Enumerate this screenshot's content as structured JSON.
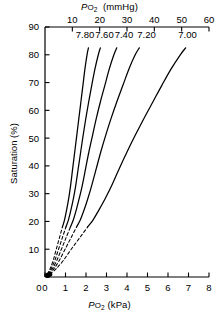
{
  "figure": {
    "title_top": {
      "symbol_p": "P",
      "symbol_o": "O",
      "symbol_sub": "2",
      "units": "(mmHg)"
    },
    "title_bottom": {
      "symbol_p": "P",
      "symbol_o": "O",
      "symbol_sub": "2",
      "units": "(kPa)"
    },
    "title_y": "Saturation (%)",
    "line_color": "#000000",
    "background_color": "#ffffff"
  },
  "chart_data": {
    "type": "line",
    "title": "",
    "xlabel": "PO2 (kPa)",
    "ylabel": "Saturation (%)",
    "xlabel_top": "PO2 (mmHg)",
    "xlim": [
      0,
      8
    ],
    "ylim": [
      0,
      90
    ],
    "xlim_top": [
      0,
      60
    ],
    "grid": false,
    "legend": "inline-curve-labels",
    "x_ticks": [
      0,
      1,
      2,
      3,
      4,
      5,
      6,
      7,
      8
    ],
    "x_tick_labels": [
      "0",
      "1",
      "2",
      "3",
      "4",
      "5",
      "6",
      "7",
      "8"
    ],
    "x_ticks_top": [
      10,
      20,
      30,
      40,
      50,
      60
    ],
    "x_tick_labels_top": [
      "10",
      "20",
      "30",
      "40",
      "50",
      "60"
    ],
    "y_ticks": [
      10,
      20,
      30,
      40,
      50,
      60,
      70,
      80,
      90
    ],
    "y_tick_labels": [
      "10",
      "20",
      "30",
      "40",
      "50",
      "60",
      "70",
      "80",
      "90"
    ],
    "solid_below_saturation": 20,
    "series": [
      {
        "name": "7.80",
        "label": "7.80",
        "label_x_kpa": 1.95,
        "label_y_pct": 86,
        "points": [
          [
            0.12,
            1
          ],
          [
            0.25,
            3
          ],
          [
            0.4,
            6
          ],
          [
            0.55,
            10
          ],
          [
            0.7,
            14
          ],
          [
            0.85,
            18
          ],
          [
            0.95,
            20.5
          ],
          [
            1.05,
            24
          ],
          [
            1.15,
            28
          ],
          [
            1.25,
            33
          ],
          [
            1.35,
            39
          ],
          [
            1.45,
            45
          ],
          [
            1.55,
            51
          ],
          [
            1.65,
            57
          ],
          [
            1.75,
            63
          ],
          [
            1.85,
            69
          ],
          [
            1.95,
            75
          ],
          [
            2.05,
            80
          ],
          [
            2.12,
            82.5
          ]
        ]
      },
      {
        "name": "7.60",
        "label": "7.60",
        "label_x_kpa": 2.9,
        "label_y_pct": 86,
        "points": [
          [
            0.14,
            1
          ],
          [
            0.3,
            3
          ],
          [
            0.48,
            6
          ],
          [
            0.66,
            10
          ],
          [
            0.84,
            14
          ],
          [
            1.02,
            18
          ],
          [
            1.14,
            20.5
          ],
          [
            1.26,
            24
          ],
          [
            1.38,
            28
          ],
          [
            1.5,
            33
          ],
          [
            1.62,
            39
          ],
          [
            1.74,
            45
          ],
          [
            1.86,
            51
          ],
          [
            1.99,
            57
          ],
          [
            2.13,
            63
          ],
          [
            2.28,
            69
          ],
          [
            2.44,
            75
          ],
          [
            2.6,
            80
          ],
          [
            2.7,
            82.5
          ]
        ]
      },
      {
        "name": "7.40",
        "label": "7.40",
        "label_x_kpa": 3.85,
        "label_y_pct": 86,
        "points": [
          [
            0.17,
            1
          ],
          [
            0.36,
            3
          ],
          [
            0.58,
            6
          ],
          [
            0.8,
            10
          ],
          [
            1.02,
            14
          ],
          [
            1.24,
            18
          ],
          [
            1.38,
            20.5
          ],
          [
            1.52,
            24
          ],
          [
            1.66,
            28
          ],
          [
            1.82,
            33
          ],
          [
            1.98,
            39
          ],
          [
            2.14,
            45
          ],
          [
            2.32,
            51
          ],
          [
            2.5,
            57
          ],
          [
            2.7,
            63
          ],
          [
            2.92,
            69
          ],
          [
            3.14,
            75
          ],
          [
            3.36,
            80
          ],
          [
            3.5,
            82.5
          ]
        ]
      },
      {
        "name": "7.20",
        "label": "7.20",
        "label_x_kpa": 4.95,
        "label_y_pct": 86,
        "points": [
          [
            0.2,
            1
          ],
          [
            0.44,
            3
          ],
          [
            0.7,
            6
          ],
          [
            0.98,
            10
          ],
          [
            1.26,
            14
          ],
          [
            1.54,
            18
          ],
          [
            1.72,
            20.5
          ],
          [
            1.9,
            24
          ],
          [
            2.08,
            28
          ],
          [
            2.28,
            33
          ],
          [
            2.5,
            39
          ],
          [
            2.72,
            45
          ],
          [
            2.96,
            51
          ],
          [
            3.22,
            57
          ],
          [
            3.5,
            63
          ],
          [
            3.8,
            69
          ],
          [
            4.1,
            75
          ],
          [
            4.4,
            80
          ],
          [
            4.6,
            82.5
          ]
        ]
      },
      {
        "name": "7.00",
        "label": "7.00",
        "label_x_kpa": 6.95,
        "label_y_pct": 86,
        "points": [
          [
            0.24,
            1
          ],
          [
            0.55,
            3
          ],
          [
            0.9,
            6
          ],
          [
            1.28,
            10
          ],
          [
            1.68,
            14
          ],
          [
            2.08,
            18
          ],
          [
            2.34,
            20.5
          ],
          [
            2.62,
            24
          ],
          [
            2.92,
            28
          ],
          [
            3.26,
            33
          ],
          [
            3.62,
            39
          ],
          [
            4.0,
            45
          ],
          [
            4.4,
            51
          ],
          [
            4.82,
            57
          ],
          [
            5.26,
            63
          ],
          [
            5.7,
            69
          ],
          [
            6.16,
            75
          ],
          [
            6.6,
            80
          ],
          [
            6.86,
            82.5
          ]
        ]
      }
    ]
  }
}
